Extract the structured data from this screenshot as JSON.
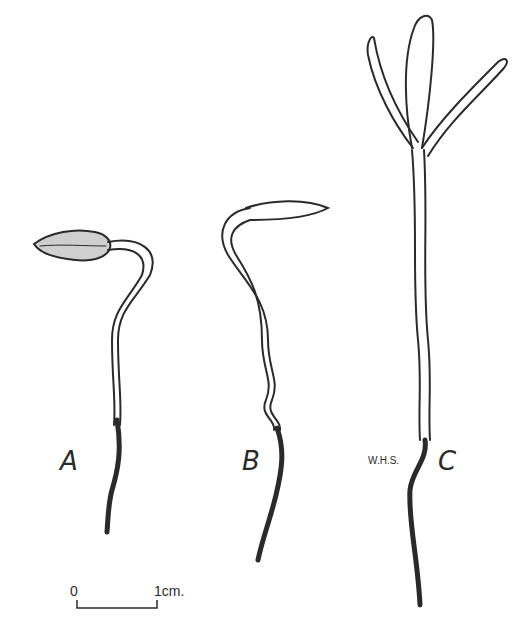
{
  "figure": {
    "panels": [
      {
        "label": "A",
        "description": "seedling with seed coat still attached, hooked hypocotyl"
      },
      {
        "label": "B",
        "description": "seedling with cotyledon emerged, hooked top"
      },
      {
        "label": "C",
        "description": "erect seedling with three cotyledons spread"
      }
    ],
    "initials": "W.H.S.",
    "scale_bar": {
      "start": "0",
      "end": "1cm."
    },
    "colors": {
      "ink": "#2a2a2a",
      "background": "#ffffff"
    }
  }
}
